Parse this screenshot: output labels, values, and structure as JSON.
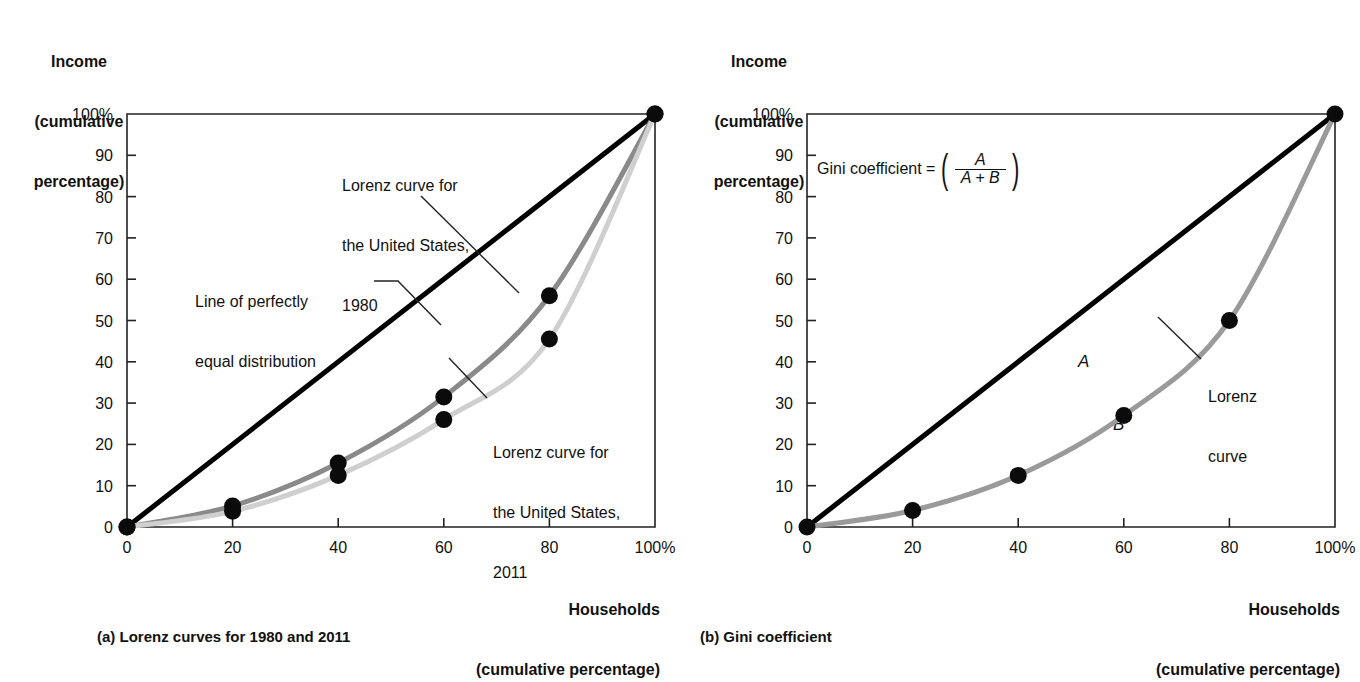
{
  "figure": {
    "background": "#ffffff",
    "ink": "#111111"
  },
  "panels": [
    {
      "id": "a",
      "caption": "(a) Lorenz curves for 1980 and 2011",
      "y_axis_title_line1": "Income",
      "y_axis_title_line2": "(cumulative",
      "y_axis_title_line3": "percentage)",
      "x_axis_title_line1": "Households",
      "x_axis_title_line2": "(cumulative percentage)",
      "annotations": [
        {
          "name": "lorenz-1980-label",
          "line1": "Lorenz curve for",
          "line2": "the United States,",
          "line3": "1980"
        },
        {
          "name": "equal-line-label",
          "line1": "Line of perfectly",
          "line2": "equal distribution",
          "line3": ""
        },
        {
          "name": "lorenz-2011-label",
          "line1": "Lorenz curve for",
          "line2": "the United States,",
          "line3": "2011"
        }
      ]
    },
    {
      "id": "b",
      "caption": "(b) Gini coefficient",
      "y_axis_title_line1": "Income",
      "y_axis_title_line2": "(cumulative",
      "y_axis_title_line3": "percentage)",
      "x_axis_title_line1": "Households",
      "x_axis_title_line2": "(cumulative percentage)",
      "formula": {
        "label": "Gini coefficient =",
        "numerator": "A",
        "denominator": "A + B"
      },
      "area_labels": {
        "upper": "A",
        "lower": "B"
      },
      "annotations": [
        {
          "name": "lorenz-curve-label",
          "line1": "Lorenz",
          "line2": "curve",
          "line3": ""
        }
      ]
    }
  ],
  "chart_data": [
    {
      "type": "line",
      "panel": "a",
      "title": "(a) Lorenz curves for 1980 and 2011",
      "xlabel": "Households (cumulative percentage)",
      "ylabel": "Income (cumulative percentage)",
      "xlim": [
        0,
        100
      ],
      "ylim": [
        0,
        100
      ],
      "grid": false,
      "xticks": [
        0,
        20,
        40,
        60,
        80,
        100
      ],
      "xticklabels": [
        "0",
        "20",
        "40",
        "60",
        "80",
        "100%"
      ],
      "yticks": [
        0,
        10,
        20,
        30,
        40,
        50,
        60,
        70,
        80,
        90,
        100
      ],
      "yticklabels": [
        "0",
        "10",
        "20",
        "30",
        "40",
        "50",
        "60",
        "70",
        "80",
        "90",
        "100%"
      ],
      "series": [
        {
          "name": "Line of perfectly equal distribution",
          "color": "#000000",
          "width": 5,
          "markers": false,
          "x": [
            0,
            100
          ],
          "values": [
            0,
            100
          ]
        },
        {
          "name": "Lorenz curve for the United States, 1980",
          "color": "#8a8a8a",
          "width": 5,
          "markers": true,
          "x": [
            0,
            20,
            40,
            60,
            80,
            100
          ],
          "values": [
            0,
            5.1,
            15.5,
            31.5,
            56.0,
            100
          ]
        },
        {
          "name": "Lorenz curve for the United States, 2011",
          "color": "#cfcfcf",
          "width": 5,
          "markers": true,
          "x": [
            0,
            20,
            40,
            60,
            80,
            100
          ],
          "values": [
            0,
            3.8,
            12.5,
            26.0,
            45.5,
            100
          ]
        }
      ]
    },
    {
      "type": "line",
      "panel": "b",
      "title": "(b) Gini coefficient",
      "xlabel": "Households (cumulative percentage)",
      "ylabel": "Income (cumulative percentage)",
      "xlim": [
        0,
        100
      ],
      "ylim": [
        0,
        100
      ],
      "grid": false,
      "xticks": [
        0,
        20,
        40,
        60,
        80,
        100
      ],
      "xticklabels": [
        "0",
        "20",
        "40",
        "60",
        "80",
        "100%"
      ],
      "yticks": [
        0,
        10,
        20,
        30,
        40,
        50,
        60,
        70,
        80,
        90,
        100
      ],
      "yticklabels": [
        "0",
        "10",
        "20",
        "30",
        "40",
        "50",
        "60",
        "70",
        "80",
        "90",
        "100%"
      ],
      "series": [
        {
          "name": "Line of perfectly equal distribution",
          "color": "#000000",
          "width": 5,
          "markers": false,
          "x": [
            0,
            100
          ],
          "values": [
            0,
            100
          ]
        },
        {
          "name": "Lorenz curve",
          "color": "#9a9a9a",
          "width": 5,
          "markers": true,
          "x": [
            0,
            20,
            40,
            60,
            80,
            100
          ],
          "values": [
            0,
            4.0,
            12.5,
            27.0,
            50.0,
            100
          ]
        }
      ]
    }
  ]
}
